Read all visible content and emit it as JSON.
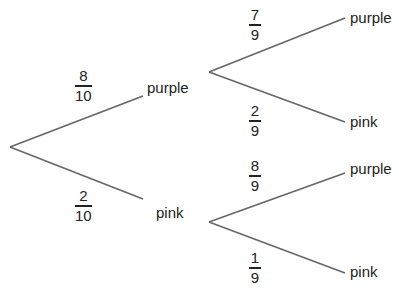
{
  "diagram": {
    "type": "probability-tree",
    "first_stage": [
      {
        "outcome": "purple",
        "prob_num": "8",
        "prob_den": "10"
      },
      {
        "outcome": "pink",
        "prob_num": "2",
        "prob_den": "10"
      }
    ],
    "second_stage": {
      "after_purple": [
        {
          "outcome": "purple",
          "prob_num": "7",
          "prob_den": "9"
        },
        {
          "outcome": "pink",
          "prob_num": "2",
          "prob_den": "9"
        }
      ],
      "after_pink": [
        {
          "outcome": "purple",
          "prob_num": "8",
          "prob_den": "9"
        },
        {
          "outcome": "pink",
          "prob_num": "1",
          "prob_den": "9"
        }
      ]
    },
    "line_color": "#666666",
    "text_color": "#222222"
  }
}
